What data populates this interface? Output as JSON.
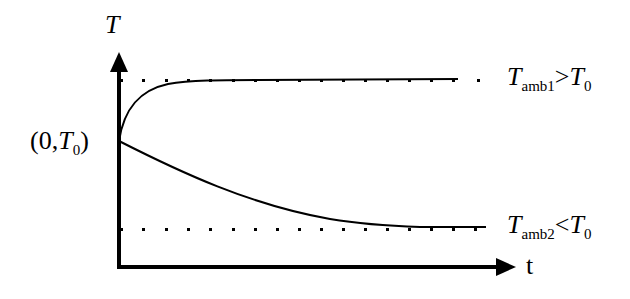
{
  "diagram": {
    "y_axis_label": "T",
    "x_axis_label": "t",
    "origin_label": {
      "open": "(0,",
      "var": "T",
      "sub": "0",
      "close": ")"
    },
    "upper_asymptote_label": {
      "var": "T",
      "sub": "amb1",
      "relation": ">",
      "rhs_var": "T",
      "rhs_sub": "0"
    },
    "lower_asymptote_label": {
      "var": "T",
      "sub": "amb2",
      "relation": "<",
      "rhs_var": "T",
      "rhs_sub": "0"
    },
    "curves": [
      {
        "name": "heating-curve",
        "description": "T rises from T0 toward Tamb1"
      },
      {
        "name": "cooling-curve",
        "description": "T falls from T0 toward Tamb2"
      }
    ],
    "colors": {
      "ink": "#000000",
      "background": "#ffffff"
    }
  }
}
